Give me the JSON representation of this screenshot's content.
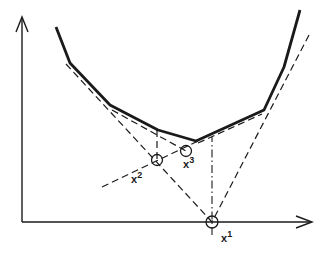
{
  "diagram": {
    "type": "cutting-plane iteration on convex function",
    "colors": {
      "ink": "#1a1a1a",
      "background": "#ffffff"
    },
    "axes": {
      "origin": [
        22,
        222
      ],
      "y_axis_top": [
        22,
        17
      ],
      "x_axis_right": [
        312,
        222
      ]
    },
    "function_polyline": [
      [
        56,
        27
      ],
      [
        70,
        63
      ],
      [
        110,
        105
      ],
      [
        158,
        130
      ],
      [
        196,
        141
      ],
      [
        264,
        110
      ],
      [
        284,
        67
      ],
      [
        300,
        10
      ]
    ],
    "cuts": {
      "left_tangent": [
        [
          66,
          64
        ],
        [
          212,
          222
        ]
      ],
      "right_tangent": [
        [
          309,
          35
        ],
        [
          212,
          222
        ]
      ],
      "cut2_left": [
        [
          110,
          108
        ],
        [
          186,
          151
        ]
      ],
      "cut3": [
        [
          100,
          188
        ],
        [
          196,
          143
        ]
      ],
      "vertical_x1": [
        [
          212,
          232
        ],
        [
          212,
          137
        ]
      ],
      "vertical_x2": [
        [
          157,
          160
        ],
        [
          157,
          130
        ]
      ]
    },
    "points": [
      {
        "id": "x1",
        "label": "x",
        "superscript": "1",
        "cx": 212,
        "cy": 222,
        "label_x": 220,
        "label_y": 241
      },
      {
        "id": "x2",
        "label": "x",
        "superscript": "2",
        "cx": 157,
        "cy": 160,
        "label_x": 130,
        "label_y": 182
      },
      {
        "id": "x3",
        "label": "x",
        "superscript": "3",
        "cx": 186,
        "cy": 151,
        "label_x": 182,
        "label_y": 167
      }
    ]
  }
}
